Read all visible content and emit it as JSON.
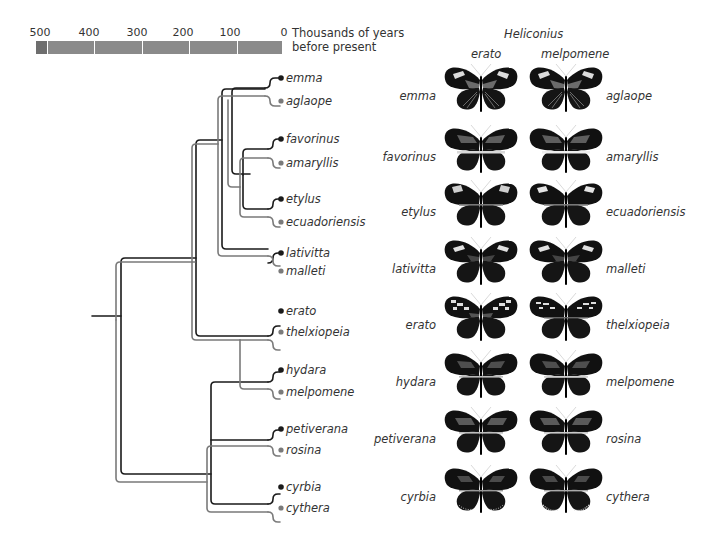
{
  "scale": {
    "ticks": [
      "500",
      "400",
      "300",
      "200",
      "100",
      "0"
    ],
    "unit_line1": "Thousands of years",
    "unit_line2": "before present",
    "bar_color": "#8a8a8a",
    "bar_oldest_color": "#6e6e6e"
  },
  "tree": {
    "erato_lineage_color": "#1a1a1a",
    "melpomene_lineage_color": "#7a7a7a",
    "tips": [
      {
        "name": "emma",
        "lineage": "erato"
      },
      {
        "name": "aglaope",
        "lineage": "melpomene"
      },
      {
        "name": "favorinus",
        "lineage": "erato"
      },
      {
        "name": "amaryllis",
        "lineage": "melpomene"
      },
      {
        "name": "etylus",
        "lineage": "erato"
      },
      {
        "name": "ecuadoriensis",
        "lineage": "melpomene"
      },
      {
        "name": "lativitta",
        "lineage": "erato"
      },
      {
        "name": "malleti",
        "lineage": "melpomene"
      },
      {
        "name": "erato",
        "lineage": "erato"
      },
      {
        "name": "thelxiopeia",
        "lineage": "melpomene"
      },
      {
        "name": "hydara",
        "lineage": "erato"
      },
      {
        "name": "melpomene",
        "lineage": "melpomene"
      },
      {
        "name": "petiverana",
        "lineage": "erato"
      },
      {
        "name": "rosina",
        "lineage": "melpomene"
      },
      {
        "name": "cyrbia",
        "lineage": "erato"
      },
      {
        "name": "cythera",
        "lineage": "melpomene"
      }
    ]
  },
  "panel": {
    "genus": "Heliconius",
    "col_left": "erato",
    "col_right": "melpomene",
    "rows": [
      {
        "left": "emma",
        "right": "aglaope",
        "pattern": "rayed"
      },
      {
        "left": "favorinus",
        "right": "amaryllis",
        "pattern": "band"
      },
      {
        "left": "etylus",
        "right": "ecuadoriensis",
        "pattern": "patch"
      },
      {
        "left": "lativitta",
        "right": "malleti",
        "pattern": "patch"
      },
      {
        "left": "erato",
        "right": "thelxiopeia",
        "pattern": "spots"
      },
      {
        "left": "hydara",
        "right": "melpomene",
        "pattern": "band"
      },
      {
        "left": "petiverana",
        "right": "rosina",
        "pattern": "band"
      },
      {
        "left": "cyrbia",
        "right": "cythera",
        "pattern": "band-fringe"
      }
    ]
  }
}
